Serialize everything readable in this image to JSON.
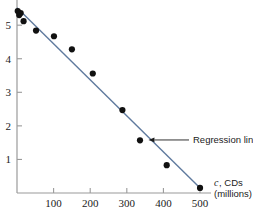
{
  "chart_data": {
    "type": "scatter",
    "title": "",
    "xlabel": "c, CDs (millions)",
    "xlabel_var": "c",
    "xlabel_rest": ", CDs",
    "xlabel_units": "(millions)",
    "ylabel": "",
    "xlim": [
      0,
      530
    ],
    "ylim": [
      0,
      5.75
    ],
    "grid": false,
    "legend": "none",
    "xticks": [
      100,
      200,
      300,
      400,
      500
    ],
    "xtick_labels": [
      "100",
      "200",
      "300",
      "400",
      "500"
    ],
    "yticks": [
      1,
      2,
      3,
      4,
      5
    ],
    "ytick_labels": [
      "1",
      "2",
      "3",
      "4",
      "5"
    ],
    "points": [
      {
        "x": 2,
        "y": 5.42
      },
      {
        "x": 6,
        "y": 5.3
      },
      {
        "x": 10,
        "y": 5.36
      },
      {
        "x": 18,
        "y": 5.12
      },
      {
        "x": 52,
        "y": 4.84
      },
      {
        "x": 101,
        "y": 4.67
      },
      {
        "x": 150,
        "y": 4.28
      },
      {
        "x": 207,
        "y": 3.56
      },
      {
        "x": 288,
        "y": 2.47
      },
      {
        "x": 336,
        "y": 1.57
      },
      {
        "x": 409,
        "y": 0.83
      },
      {
        "x": 500,
        "y": 0.15
      }
    ],
    "series": [
      {
        "name": "Regression line",
        "type": "line",
        "x": [
          0,
          505
        ],
        "y": [
          5.52,
          0.1
        ]
      }
    ],
    "annotations": [
      {
        "text": "Regression line",
        "target_x": 370,
        "target_y": 1.58
      }
    ]
  },
  "colors": {
    "regression_line": "#5f7a9e",
    "point": "#111111",
    "axis": "#9a9a9a",
    "text": "#1b1b1b"
  }
}
